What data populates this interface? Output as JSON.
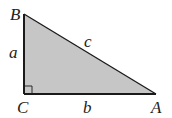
{
  "diagram": {
    "fill_color": "#c6c6c6",
    "stroke_color": "#1a1a1a",
    "vertices": {
      "A": {
        "label": "A",
        "x": 156,
        "y": 94
      },
      "B": {
        "label": "B",
        "x": 24,
        "y": 14
      },
      "C": {
        "label": "C",
        "x": 24,
        "y": 94
      }
    },
    "sides": {
      "a": {
        "label": "a",
        "between": [
          "B",
          "C"
        ]
      },
      "b": {
        "label": "b",
        "between": [
          "C",
          "A"
        ]
      },
      "c": {
        "label": "c",
        "between": [
          "A",
          "B"
        ]
      }
    },
    "right_angle_at": "C"
  }
}
